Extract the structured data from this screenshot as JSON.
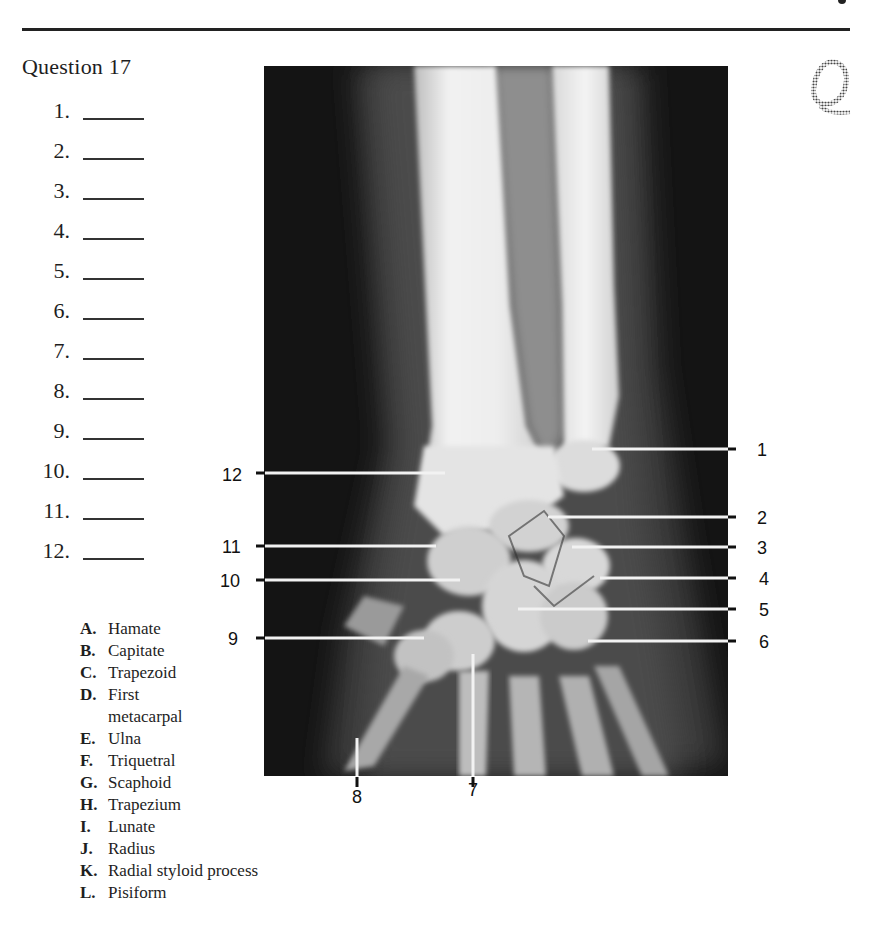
{
  "header": {
    "question_title": "Question 17",
    "logo_letter": "Q"
  },
  "answers": [
    {
      "number": "1.",
      "value": ""
    },
    {
      "number": "2.",
      "value": ""
    },
    {
      "number": "3.",
      "value": ""
    },
    {
      "number": "4.",
      "value": ""
    },
    {
      "number": "5.",
      "value": ""
    },
    {
      "number": "6.",
      "value": ""
    },
    {
      "number": "7.",
      "value": ""
    },
    {
      "number": "8.",
      "value": ""
    },
    {
      "number": "9.",
      "value": ""
    },
    {
      "number": "10.",
      "value": ""
    },
    {
      "number": "11.",
      "value": ""
    },
    {
      "number": "12.",
      "value": ""
    }
  ],
  "options": [
    {
      "letter": "A.",
      "text": "Hamate"
    },
    {
      "letter": "B.",
      "text": "Capitate"
    },
    {
      "letter": "C.",
      "text": "Trapezoid"
    },
    {
      "letter": "D.",
      "text": "First",
      "continuation": "metacarpal"
    },
    {
      "letter": "E.",
      "text": "Ulna"
    },
    {
      "letter": "F.",
      "text": "Triquetral"
    },
    {
      "letter": "G.",
      "text": "Scaphoid"
    },
    {
      "letter": "H.",
      "text": "Trapezium"
    },
    {
      "letter": "I.",
      "text": "Lunate"
    },
    {
      "letter": "J.",
      "text": "Radius"
    },
    {
      "letter": "K.",
      "text": "Radial styloid process"
    },
    {
      "letter": "L.",
      "text": "Pisiform"
    }
  ],
  "figure": {
    "labels_right": [
      {
        "num": "1",
        "y": 449,
        "line_x1": 592
      },
      {
        "num": "2",
        "y": 517,
        "line_x1": 548
      },
      {
        "num": "3",
        "y": 547,
        "line_x1": 572
      },
      {
        "num": "4",
        "y": 578,
        "line_x1": 600
      },
      {
        "num": "5",
        "y": 609,
        "line_x1": 518
      },
      {
        "num": "6",
        "y": 641,
        "line_x1": 588
      }
    ],
    "labels_left": [
      {
        "num": "12",
        "y": 473,
        "line_x2": 445
      },
      {
        "num": "11",
        "y": 546,
        "line_x2": 436
      },
      {
        "num": "10",
        "y": 580,
        "line_x2": 460
      },
      {
        "num": "9",
        "y": 638,
        "line_x2": 424
      }
    ],
    "labels_bottom": [
      {
        "num": "8",
        "x": 357,
        "line_y1": 738
      },
      {
        "num": "7",
        "x": 473,
        "line_y1": 654
      }
    ]
  }
}
